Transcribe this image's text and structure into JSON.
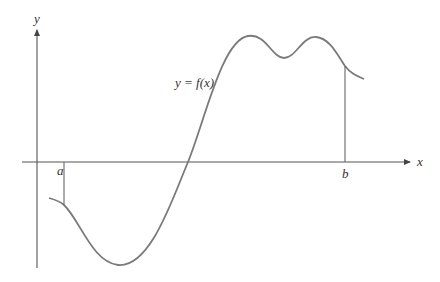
{
  "diagram": {
    "axes": {
      "x_label": "x",
      "y_label": "y"
    },
    "curve_label": "y = f(x)",
    "bounds": {
      "left_label": "a",
      "right_label": "b"
    },
    "colors": {
      "background": "#ffffff",
      "axis": "#555555",
      "curve": "#7a7a7a",
      "text": "#333333"
    }
  }
}
